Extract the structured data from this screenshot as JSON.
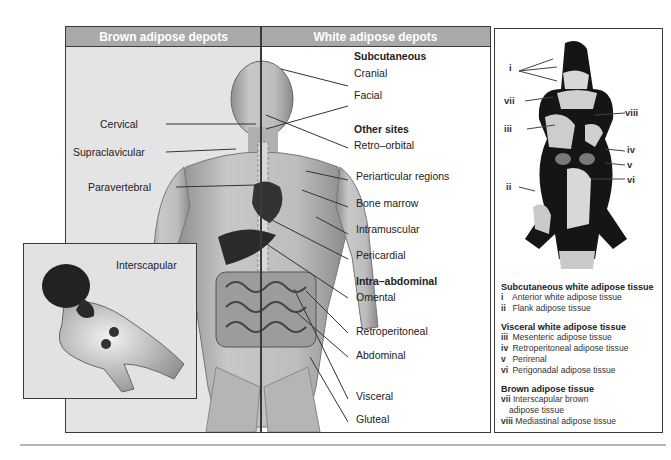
{
  "figure": {
    "headers": {
      "brown": "Brown adipose depots",
      "white": "White adipose depots"
    },
    "brown_labels": [
      {
        "text": "Cervical"
      },
      {
        "text": "Supraclavicular"
      },
      {
        "text": "Paravertebral"
      }
    ],
    "inset": {
      "label": "Interscapular"
    },
    "white_sections": {
      "subcutaneous": {
        "heading": "Subcutaneous",
        "items": [
          "Cranial",
          "Facial"
        ]
      },
      "other_sites": {
        "heading": "Other sites",
        "items": [
          "Retro–orbital",
          "Periarticular regions",
          "Bone marrow",
          "Intramuscular",
          "Pericardial"
        ]
      },
      "intra_abdominal": {
        "heading": "Intra–abdominal",
        "items": [
          "Omental",
          "Retroperitoneal",
          "Abdominal",
          "Visceral",
          "Gluteal"
        ]
      }
    }
  },
  "mouse": {
    "markers": {
      "i": "i",
      "ii": "ii",
      "iii": "iii",
      "iv": "iv",
      "v": "v",
      "vi": "vi",
      "vii": "vii",
      "viii": "viii"
    },
    "legend": {
      "subcutaneous": {
        "heading": "Subcutaneous white adipose tissue",
        "items": [
          {
            "num": "i",
            "text": "Anterior white adipose tissue"
          },
          {
            "num": "ii",
            "text": "Flank adipose tissue"
          }
        ]
      },
      "visceral": {
        "heading": "Visceral white adipose tissue",
        "items": [
          {
            "num": "iii",
            "text": "Mesenteric adipose tissue"
          },
          {
            "num": "iv",
            "text": "Retroperitoneal adipose tissue"
          },
          {
            "num": "v",
            "text": "Perirenal"
          },
          {
            "num": "vi",
            "text": "Perigonadal adipose tissue"
          }
        ]
      },
      "brown": {
        "heading": "Brown adipose tissue",
        "items": [
          {
            "num": "vii",
            "text": "Interscapular brown",
            "text2": "adipose tissue"
          },
          {
            "num": "viii",
            "text": "Mediastinal adipose tissue"
          }
        ]
      }
    }
  },
  "colors": {
    "header_bg": "#a9a9a9",
    "border": "#3a3a3a",
    "left_bg": "#e4e4e4"
  }
}
